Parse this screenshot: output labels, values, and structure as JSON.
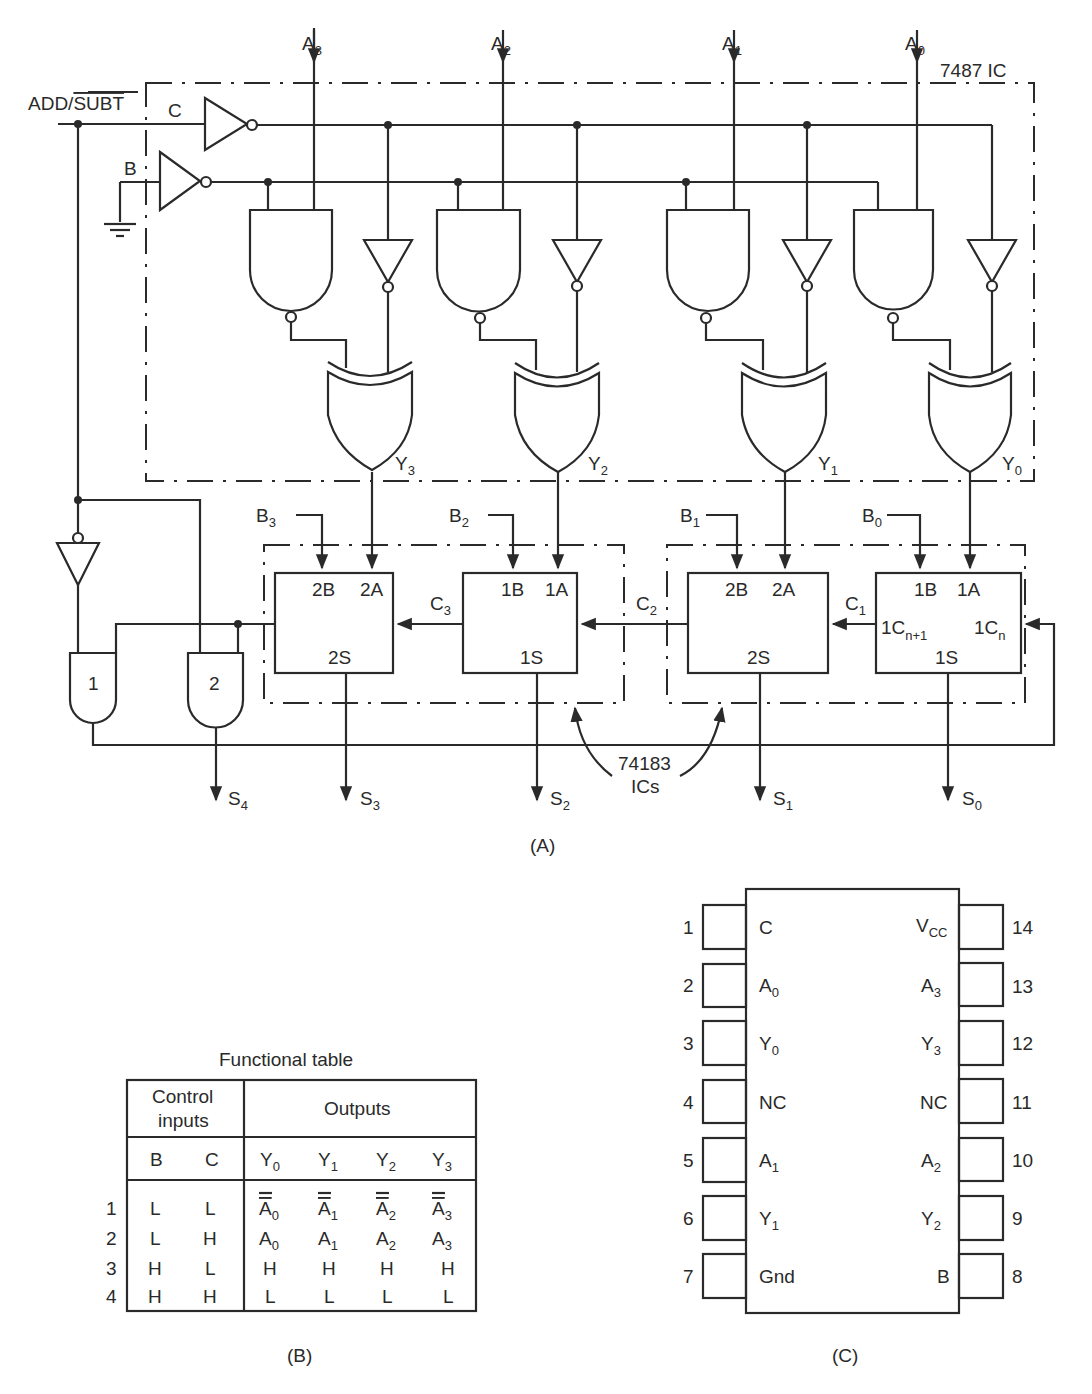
{
  "figure_a": {
    "caption": "(A)",
    "control_label": "ADD/",
    "control_label_bar": "SUBT",
    "c_label": "C",
    "b_label": "B",
    "ic_7487_label": "7487 IC",
    "ic_74183_label_line1": "74183",
    "ic_74183_label_line2": "ICs",
    "inputs_a": [
      {
        "base": "A",
        "sub": "3"
      },
      {
        "base": "A",
        "sub": "2"
      },
      {
        "base": "A",
        "sub": "1"
      },
      {
        "base": "A",
        "sub": "0"
      }
    ],
    "outputs_y": [
      {
        "base": "Y",
        "sub": "3"
      },
      {
        "base": "Y",
        "sub": "2"
      },
      {
        "base": "Y",
        "sub": "1"
      },
      {
        "base": "Y",
        "sub": "0"
      }
    ],
    "inputs_b": [
      {
        "base": "B",
        "sub": "3"
      },
      {
        "base": "B",
        "sub": "2"
      },
      {
        "base": "B",
        "sub": "1"
      },
      {
        "base": "B",
        "sub": "0"
      }
    ],
    "adder_blocks": [
      {
        "b_pin": "2B",
        "a_pin": "2A",
        "s_pin": "2S"
      },
      {
        "b_pin": "1B",
        "a_pin": "1A",
        "s_pin": "1S"
      },
      {
        "b_pin": "2B",
        "a_pin": "2A",
        "s_pin": "2S"
      },
      {
        "b_pin": "1B",
        "a_pin": "1A",
        "s_pin": "1S",
        "cout_pin": "1C",
        "cout_sub": "n+1",
        "cin_pin": "1C",
        "cin_sub": "n"
      }
    ],
    "carries": [
      {
        "base": "C",
        "sub": "3"
      },
      {
        "base": "C",
        "sub": "2"
      },
      {
        "base": "C",
        "sub": "1"
      }
    ],
    "gate_labels": [
      "1",
      "2"
    ],
    "sums": [
      {
        "base": "S",
        "sub": "4"
      },
      {
        "base": "S",
        "sub": "3"
      },
      {
        "base": "S",
        "sub": "2"
      },
      {
        "base": "S",
        "sub": "1"
      },
      {
        "base": "S",
        "sub": "0"
      }
    ]
  },
  "figure_b": {
    "caption": "(B)",
    "title": "Functional table",
    "header_control_1": "Control",
    "header_control_2": "inputs",
    "header_outputs": "Outputs",
    "columns": [
      {
        "base": "B",
        "sub": ""
      },
      {
        "base": "C",
        "sub": ""
      },
      {
        "base": "Y",
        "sub": "0"
      },
      {
        "base": "Y",
        "sub": "1"
      },
      {
        "base": "Y",
        "sub": "2"
      },
      {
        "base": "Y",
        "sub": "3"
      }
    ],
    "rows": [
      {
        "num": "1",
        "b": "L",
        "c": "L",
        "outputs": [
          {
            "base": "A",
            "sub": "0",
            "bar": true
          },
          {
            "base": "A",
            "sub": "1",
            "bar": true
          },
          {
            "base": "A",
            "sub": "2",
            "bar": true
          },
          {
            "base": "A",
            "sub": "3",
            "bar": true
          }
        ]
      },
      {
        "num": "2",
        "b": "L",
        "c": "H",
        "outputs": [
          {
            "base": "A",
            "sub": "0",
            "bar": false
          },
          {
            "base": "A",
            "sub": "1",
            "bar": false
          },
          {
            "base": "A",
            "sub": "2",
            "bar": false
          },
          {
            "base": "A",
            "sub": "3",
            "bar": false
          }
        ]
      },
      {
        "num": "3",
        "b": "H",
        "c": "L",
        "outputs": [
          {
            "base": "H",
            "sub": ""
          },
          {
            "base": "H",
            "sub": ""
          },
          {
            "base": "H",
            "sub": ""
          },
          {
            "base": "H",
            "sub": ""
          }
        ]
      },
      {
        "num": "4",
        "b": "H",
        "c": "H",
        "outputs": [
          {
            "base": "L",
            "sub": ""
          },
          {
            "base": "L",
            "sub": ""
          },
          {
            "base": "L",
            "sub": ""
          },
          {
            "base": "L",
            "sub": ""
          }
        ]
      }
    ]
  },
  "figure_c": {
    "caption": "(C)",
    "left_pins": [
      {
        "num": "1",
        "base": "C",
        "sub": ""
      },
      {
        "num": "2",
        "base": "A",
        "sub": "0"
      },
      {
        "num": "3",
        "base": "Y",
        "sub": "0"
      },
      {
        "num": "4",
        "base": "NC",
        "sub": ""
      },
      {
        "num": "5",
        "base": "A",
        "sub": "1"
      },
      {
        "num": "6",
        "base": "Y",
        "sub": "1"
      },
      {
        "num": "7",
        "base": "Gnd",
        "sub": ""
      }
    ],
    "right_pins": [
      {
        "num": "14",
        "base": "V",
        "sub": "CC"
      },
      {
        "num": "13",
        "base": "A",
        "sub": "3"
      },
      {
        "num": "12",
        "base": "Y",
        "sub": "3"
      },
      {
        "num": "11",
        "base": "NC",
        "sub": ""
      },
      {
        "num": "10",
        "base": "A",
        "sub": "2"
      },
      {
        "num": "9",
        "base": "Y",
        "sub": "2"
      },
      {
        "num": "8",
        "base": "B",
        "sub": ""
      }
    ]
  }
}
